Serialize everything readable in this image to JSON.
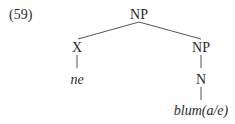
{
  "example_number": "(59)",
  "tree": {
    "root": {
      "label": "NP",
      "children": [
        {
          "label": "X",
          "children": [
            {
              "label": "ne",
              "italic": true
            }
          ]
        },
        {
          "label": "NP",
          "children": [
            {
              "label": "N",
              "children": [
                {
                  "label": "blum(a/e)",
                  "italic": true
                }
              ]
            }
          ]
        }
      ]
    }
  },
  "colors": {
    "text": "#2a2a2a",
    "line": "#555555"
  }
}
